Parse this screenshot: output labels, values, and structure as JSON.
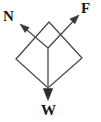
{
  "figure": {
    "type": "physics-force-diagram",
    "background_color": "#ffffff",
    "stroke_color": "#4a4a4a",
    "label_color": "#171717",
    "width": 101,
    "height": 122
  },
  "labels": {
    "normal_force": "N",
    "applied_force": "F",
    "weight": "W"
  },
  "vectors": [
    {
      "name": "N",
      "label": "N",
      "origin": [
        48,
        48
      ],
      "tip": [
        20,
        24
      ],
      "direction": "up-left",
      "has_arrowhead": true
    },
    {
      "name": "F",
      "label": "F",
      "origin": [
        48,
        48
      ],
      "tip": [
        79,
        15
      ],
      "direction": "up-right",
      "has_arrowhead": true
    },
    {
      "name": "W",
      "label": "W",
      "origin": [
        48,
        48
      ],
      "tip": [
        48,
        100
      ],
      "direction": "down",
      "has_arrowhead": true
    }
  ],
  "parallelogram": {
    "name": "force-parallelogram",
    "vertices": [
      [
        49,
        22
      ],
      [
        16,
        59
      ],
      [
        48,
        88
      ],
      [
        82,
        58
      ]
    ],
    "closed": true,
    "filled": false
  },
  "label_positions": {
    "N": [
      10,
      16
    ],
    "F": [
      87,
      8
    ],
    "W": [
      48,
      110
    ]
  }
}
